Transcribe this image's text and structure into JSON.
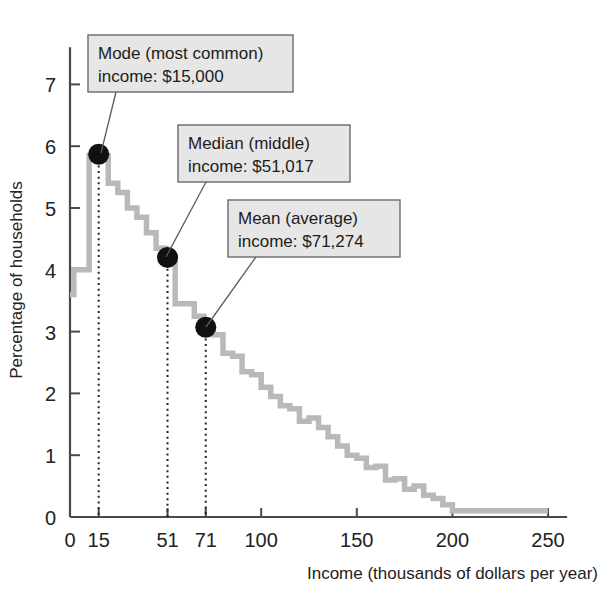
{
  "chart_data": {
    "type": "line",
    "subtype": "step-histogram",
    "title": "",
    "xlabel": "Income (thousands of dollars per year)",
    "ylabel": "Percentage of households",
    "xlim": [
      0,
      260
    ],
    "ylim": [
      0,
      7.6
    ],
    "grid": false,
    "legend": null,
    "x_ticks": [
      0,
      15,
      51,
      71,
      100,
      150,
      200,
      250
    ],
    "x_tick_labels": [
      "0",
      "15",
      "51",
      "71",
      "100",
      "150",
      "200",
      "250"
    ],
    "y_ticks": [
      0,
      1,
      2,
      3,
      4,
      5,
      6,
      7
    ],
    "y_tick_labels": [
      "0",
      "1",
      "2",
      "3",
      "4",
      "5",
      "6",
      "7"
    ],
    "step_x": [
      0,
      2,
      5,
      10,
      15,
      20,
      25,
      30,
      35,
      40,
      45,
      50,
      55,
      60,
      65,
      70,
      75,
      80,
      85,
      90,
      95,
      100,
      105,
      110,
      115,
      120,
      125,
      130,
      135,
      140,
      145,
      150,
      155,
      160,
      165,
      170,
      175,
      180,
      185,
      190,
      195,
      200,
      250
    ],
    "step_y": [
      3.6,
      4.0,
      4.0,
      5.85,
      5.85,
      5.4,
      5.25,
      5.0,
      4.85,
      4.6,
      4.35,
      4.2,
      3.45,
      3.45,
      3.25,
      3.05,
      2.95,
      2.65,
      2.6,
      2.35,
      2.3,
      2.1,
      1.95,
      1.8,
      1.75,
      1.55,
      1.6,
      1.45,
      1.3,
      1.15,
      1.0,
      0.95,
      0.8,
      0.82,
      0.6,
      0.62,
      0.45,
      0.5,
      0.35,
      0.3,
      0.2,
      0.1,
      0.1
    ],
    "markers": [
      {
        "name": "mode",
        "x": 15,
        "y": 5.87
      },
      {
        "name": "median",
        "x": 51,
        "y": 4.2
      },
      {
        "name": "mean",
        "x": 71,
        "y": 3.07
      }
    ],
    "annotations": [
      {
        "name": "mode",
        "line1": "Mode (most common)",
        "line2": "income: $15,000",
        "box": {
          "x": 88,
          "y": 35,
          "w": 205,
          "h": 57
        },
        "leader_to": {
          "x": 101,
          "y": 153
        }
      },
      {
        "name": "median",
        "line1": "Median (middle)",
        "line2": "income: $51,017",
        "box": {
          "x": 178,
          "y": 125,
          "w": 172,
          "h": 57
        },
        "leader_to": {
          "x": 166,
          "y": 257
        }
      },
      {
        "name": "mean",
        "line1": "Mean (average)",
        "line2": "income: $71,274",
        "box": {
          "x": 228,
          "y": 200,
          "w": 172,
          "h": 57
        },
        "leader_to": {
          "x": 206,
          "y": 327
        }
      }
    ],
    "colors": {
      "curve": "#b9b9b9",
      "marker": "#111111",
      "axis": "#4a4a4a",
      "callout_fill": "#e6e6e6",
      "callout_stroke": "#6a6a6a",
      "background": "#ffffff"
    }
  }
}
